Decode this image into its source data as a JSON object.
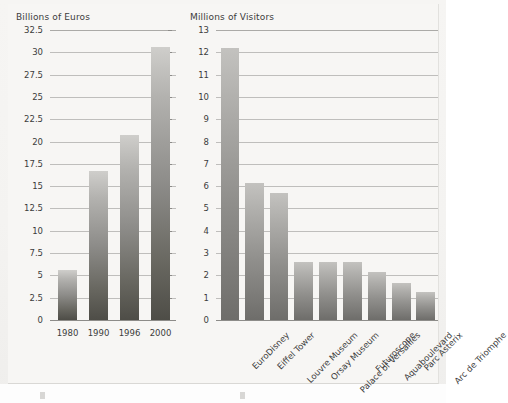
{
  "page": {
    "background_color": "#f7f6f4",
    "bar_gradient_top": "#cfcecb",
    "bar_gradient_bottom": "#4e4d47"
  },
  "chart_data": [
    {
      "id": "left",
      "type": "bar",
      "title": "Billions of Euros",
      "xlabel": "",
      "ylabel": "Billions of Euros",
      "categories": [
        "1980",
        "1990",
        "1996",
        "2000"
      ],
      "values": [
        5.6,
        16.7,
        20.7,
        30.6
      ],
      "ylim": [
        0,
        32.5
      ],
      "yticks": [
        "0",
        "2.5",
        "5",
        "7.5",
        "10",
        "12.5",
        "15",
        "17.5",
        "20",
        "22.5",
        "25",
        "27.5",
        "30",
        "32.5"
      ],
      "ytick_values": [
        0,
        2.5,
        5,
        7.5,
        10,
        12.5,
        15,
        17.5,
        20,
        22.5,
        25,
        27.5,
        30,
        32.5
      ],
      "grid": true,
      "legend": "none"
    },
    {
      "id": "right",
      "type": "bar",
      "title": "Millions of Visitors",
      "xlabel": "",
      "ylabel": "Millions of Visitors",
      "categories": [
        "EuroDisney",
        "Eiffel Tower",
        "Louvre Museum",
        "Orsay Museum",
        "Palace of Versailles",
        "Futuroscope",
        "Aquaboulevard",
        "Parc Asterix",
        "Arc de Triomphe"
      ],
      "values": [
        12.2,
        6.15,
        5.7,
        2.6,
        2.6,
        2.6,
        2.15,
        1.65,
        1.25
      ],
      "ylim": [
        0,
        13
      ],
      "yticks": [
        "0",
        "1",
        "2",
        "3",
        "4",
        "5",
        "6",
        "7",
        "8",
        "9",
        "10",
        "11",
        "12",
        "13"
      ],
      "ytick_values": [
        0,
        1,
        2,
        3,
        4,
        5,
        6,
        7,
        8,
        9,
        10,
        11,
        12,
        13
      ],
      "grid": true,
      "legend": "none"
    }
  ]
}
